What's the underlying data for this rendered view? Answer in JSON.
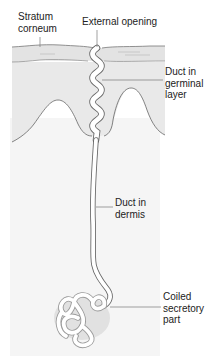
{
  "diagram": {
    "labels": [
      {
        "id": "stratum_corneum",
        "text": "Stratum\ncorneum"
      },
      {
        "id": "external_opening",
        "text": "External opening"
      },
      {
        "id": "duct_germinal",
        "text": "Duct in\ngerminal\nlayer"
      },
      {
        "id": "duct_dermis",
        "text": "Duct in\ndermis"
      },
      {
        "id": "coiled_secretory",
        "text": "Coiled\nsecretory\npart"
      }
    ],
    "regions": [
      {
        "name": "stratum-corneum",
        "color": "#e4e4e4"
      },
      {
        "name": "germinal-layer",
        "color": "#e9e9e9"
      },
      {
        "name": "dermis",
        "color": "#f4f4f4"
      }
    ],
    "colors": {
      "outline": "#6a6a6a",
      "leader_line": "#7a7a7a",
      "duct_fill": "#ffffff",
      "coil_shadow": "#b8b8b8"
    }
  }
}
